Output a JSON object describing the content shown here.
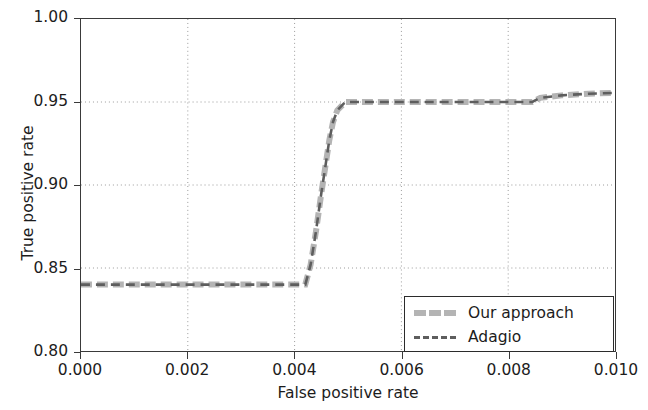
{
  "chart_data": {
    "type": "line",
    "title": "",
    "xlabel": "False positive rate",
    "ylabel": "True positive rate",
    "xlim": [
      0.0,
      0.01
    ],
    "ylim": [
      0.8,
      1.0
    ],
    "xticks": [
      "0.000",
      "0.002",
      "0.004",
      "0.006",
      "0.008",
      "0.010"
    ],
    "xtick_values": [
      0.0,
      0.002,
      0.004,
      0.006,
      0.008,
      0.01
    ],
    "yticks": [
      "0.80",
      "0.85",
      "0.90",
      "0.95",
      "1.00"
    ],
    "ytick_values": [
      0.8,
      0.85,
      0.9,
      0.95,
      1.0
    ],
    "grid": true,
    "grid_style": "dotted",
    "legend_position": "lower right",
    "series": [
      {
        "name": "Our approach",
        "style": "solid-thick",
        "color": "#b4b4b4",
        "x": [
          0.0,
          0.0008,
          0.0016,
          0.0024,
          0.0032,
          0.004,
          0.0042,
          0.0043,
          0.0044,
          0.0045,
          0.00458,
          0.00465,
          0.00472,
          0.0048,
          0.00495,
          0.0055,
          0.0062,
          0.007,
          0.0078,
          0.00845,
          0.0086,
          0.009,
          0.0095,
          0.01
        ],
        "y": [
          0.84,
          0.84,
          0.84,
          0.84,
          0.84,
          0.84,
          0.84,
          0.852,
          0.872,
          0.895,
          0.912,
          0.927,
          0.938,
          0.945,
          0.95,
          0.95,
          0.95,
          0.95,
          0.95,
          0.95,
          0.9525,
          0.954,
          0.955,
          0.9555
        ]
      },
      {
        "name": "Adagio",
        "style": "dashed",
        "color": "#5e5e5e",
        "x": [
          0.0,
          0.0008,
          0.0016,
          0.0024,
          0.0032,
          0.004,
          0.0042,
          0.0043,
          0.0044,
          0.0045,
          0.00458,
          0.00465,
          0.00472,
          0.0048,
          0.00495,
          0.0055,
          0.0062,
          0.007,
          0.0078,
          0.00845,
          0.0086,
          0.009,
          0.0095,
          0.01
        ],
        "y": [
          0.84,
          0.84,
          0.84,
          0.84,
          0.84,
          0.84,
          0.84,
          0.852,
          0.872,
          0.895,
          0.912,
          0.927,
          0.938,
          0.945,
          0.95,
          0.95,
          0.95,
          0.95,
          0.95,
          0.95,
          0.9525,
          0.954,
          0.955,
          0.9555
        ]
      }
    ],
    "annotations": []
  },
  "legend": {
    "entries": [
      {
        "label": "Our approach"
      },
      {
        "label": "Adagio"
      }
    ]
  },
  "colors": {
    "axis": "#3a3a3a",
    "grid": "#9a9a9a",
    "our_approach": "#b4b4b4",
    "adagio": "#5e5e5e",
    "background": "#ffffff",
    "text": "#1c1c1c"
  }
}
